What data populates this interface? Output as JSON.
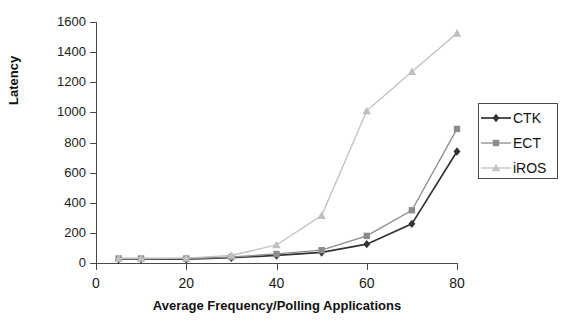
{
  "chart_data": {
    "type": "line",
    "title": "",
    "xlabel": "Average Frequency/Polling Applications",
    "ylabel": "Latency",
    "x": [
      5,
      10,
      20,
      30,
      40,
      50,
      60,
      70,
      80
    ],
    "xlim": [
      0,
      80
    ],
    "ylim": [
      0,
      1600
    ],
    "xticks": [
      0,
      20,
      40,
      60,
      80
    ],
    "yticks": [
      0,
      200,
      400,
      600,
      800,
      1000,
      1200,
      1400,
      1600
    ],
    "grid": false,
    "legend_position": "right",
    "series": [
      {
        "name": "CTK",
        "marker": "diamond",
        "color": "#333333",
        "values": [
          25,
          25,
          25,
          35,
          50,
          70,
          125,
          260,
          740
        ]
      },
      {
        "name": "ECT",
        "marker": "square",
        "color": "#8c8c8c",
        "values": [
          30,
          30,
          30,
          40,
          60,
          85,
          180,
          350,
          890
        ]
      },
      {
        "name": "iROS",
        "marker": "triangle",
        "color": "#c0c0c0",
        "values": [
          30,
          30,
          32,
          50,
          120,
          315,
          1010,
          1270,
          1525
        ]
      }
    ]
  },
  "legend": {
    "items": [
      {
        "label": "CTK"
      },
      {
        "label": "ECT"
      },
      {
        "label": "iROS"
      }
    ]
  },
  "axes": {
    "y_tick_labels": [
      "1600",
      "1400",
      "1200",
      "1000",
      "800",
      "600",
      "400",
      "200",
      "0"
    ],
    "x_tick_labels": [
      "0",
      "20",
      "40",
      "60",
      "80"
    ],
    "y_title": "Latency",
    "x_title": "Average Frequency/Polling Applications"
  }
}
